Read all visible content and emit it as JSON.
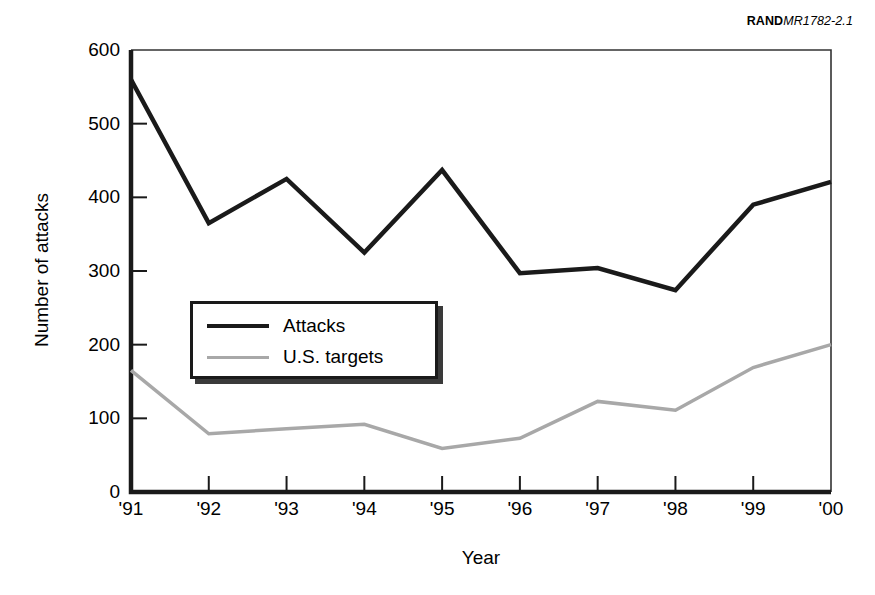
{
  "source_tag": {
    "brand": "RAND",
    "doc_id": "MR1782-2.1"
  },
  "chart_data": {
    "type": "line",
    "title": "",
    "xlabel": "Year",
    "ylabel": "Number of attacks",
    "categories": [
      "'91",
      "'92",
      "'93",
      "'94",
      "'95",
      "'96",
      "'97",
      "'98",
      "'99",
      "'00"
    ],
    "x": [
      1991,
      1992,
      1993,
      1994,
      1995,
      1996,
      1997,
      1998,
      1999,
      2000
    ],
    "series": [
      {
        "name": "Attacks",
        "color": "#1a1a1a",
        "values": [
          560,
          365,
          425,
          325,
          437,
          297,
          304,
          274,
          390,
          421
        ]
      },
      {
        "name": "U.S. targets",
        "color": "#a8a8a8",
        "values": [
          165,
          79,
          86,
          92,
          59,
          73,
          123,
          111,
          169,
          200
        ]
      }
    ],
    "ylim": [
      0,
      600
    ],
    "yticks": [
      0,
      100,
      200,
      300,
      400,
      500,
      600
    ],
    "ytick_labels": [
      "0",
      "100",
      "200",
      "300",
      "400",
      "500",
      "600"
    ],
    "grid": false,
    "legend_position": "center-left"
  },
  "legend": {
    "items": [
      {
        "label": "Attacks"
      },
      {
        "label": "U.S. targets"
      }
    ]
  }
}
